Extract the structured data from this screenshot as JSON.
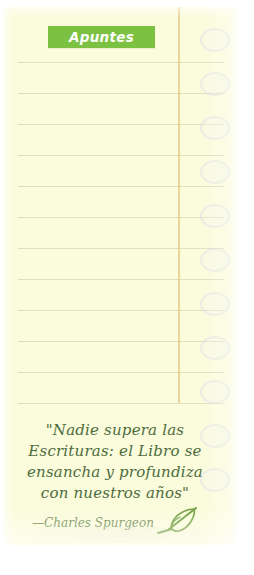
{
  "page": {
    "title": "Apuntes",
    "background_color": "#fbfcdb",
    "paper_edge_color": "#ffffff"
  },
  "tag": {
    "label": "Apuntes",
    "background_color": "#7cc142",
    "text_color": "#ffffff"
  },
  "ruled_paper": {
    "line_color": "#d9d9b4",
    "margin_line_color": "#e8cf93",
    "line_count": 13,
    "line_positions": [
      62,
      93,
      124,
      155,
      186,
      217,
      248,
      279,
      310,
      341,
      372,
      396,
      403
    ],
    "hole_positions": [
      28,
      72,
      116,
      160,
      204,
      248,
      292,
      336,
      380,
      424,
      468
    ],
    "hole_color": "#ccd2e1"
  },
  "quote": {
    "lines": [
      "\"Nadie supera las",
      "Escrituras: el Libro se",
      "ensancha y profundiza",
      "con nuestros años\""
    ],
    "attribution": "—Charles Spurgeon",
    "text_color": "#4e6b3e",
    "attribution_color": "#6f8a52",
    "icon": "quill-pen-icon",
    "icon_color": "#6f9e3f"
  }
}
